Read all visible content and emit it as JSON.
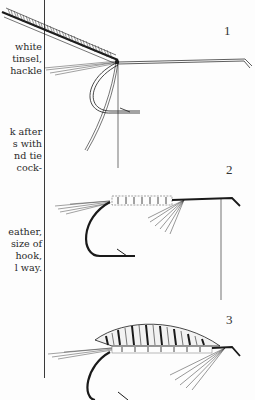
{
  "document": {
    "text_column": {
      "paragraph_1": [
        "white",
        "tinsel,",
        "hackle"
      ],
      "paragraph_2": [
        "k after",
        "s with",
        "nd tie",
        " cock-"
      ],
      "paragraph_3": [
        "eather,",
        "size of",
        " hook,",
        "l way."
      ]
    },
    "figures": [
      {
        "label": "1",
        "subject": "hook with hackle feather and tinsel tied in"
      },
      {
        "label": "2",
        "subject": "hook with tinsel body, tail and throat hackle"
      },
      {
        "label": "3",
        "subject": "finished wet fly with barred wing"
      }
    ],
    "colors": {
      "ink": "#1a1a1a",
      "paper": "#fdfdfd"
    }
  }
}
